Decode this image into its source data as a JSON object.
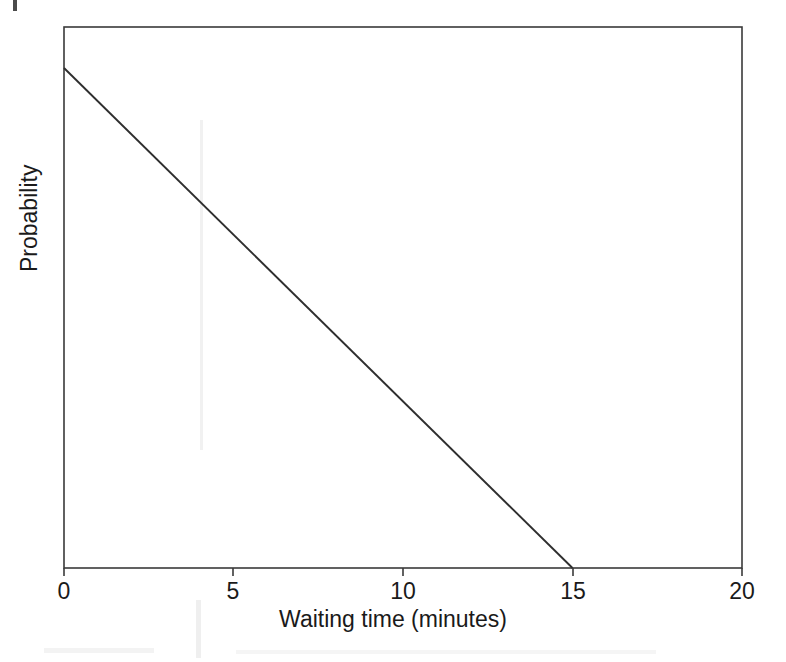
{
  "figure": {
    "background_color": "#ffffff",
    "line_color": "#2e2e2e",
    "axis_color": "#3a3a3a",
    "text_color": "#1a1a1a"
  },
  "chart_data": {
    "type": "line",
    "title": "",
    "subtitle": "",
    "xlabel": "Waiting time (minutes)",
    "ylabel": "Probability",
    "xlim": [
      0,
      20
    ],
    "ylim": [
      0,
      1
    ],
    "xticks": [
      0,
      5,
      10,
      15,
      20
    ],
    "xticklabels": [
      "0",
      "5",
      "10",
      "15",
      "20"
    ],
    "yticks": [],
    "yticklabels": [],
    "grid": false,
    "legend": null,
    "legend_position": "none",
    "annotations": [],
    "series": [
      {
        "name": "Probability of waiting longer than t",
        "x": [
          0,
          15,
          20
        ],
        "y": [
          1,
          0,
          0
        ],
        "color": "#2e2e2e",
        "style": "solid",
        "note": "Linearly decreasing from its maximum at t = 0 to zero at t = 15 minutes; flat at zero from 15 to 20 (not drawn)"
      }
    ],
    "drawn_segment": {
      "x_start": 0,
      "y_start": 1,
      "x_end": 15,
      "y_end": 0
    }
  },
  "axis_labels": {
    "x_title": "Waiting time (minutes)",
    "y_title": "Probability",
    "x_tick_0": "0",
    "x_tick_1": "5",
    "x_tick_2": "10",
    "x_tick_3": "15",
    "x_tick_4": "20"
  }
}
